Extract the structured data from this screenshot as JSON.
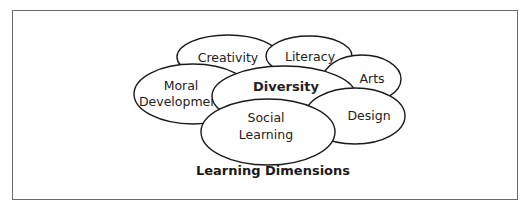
{
  "diagram": {
    "title": "Learning Dimensions",
    "nodes": [
      {
        "id": "creativity",
        "lines": [
          "Creativity"
        ],
        "bold": false
      },
      {
        "id": "literacy",
        "lines": [
          "Literacy"
        ],
        "bold": false
      },
      {
        "id": "arts",
        "lines": [
          "Arts"
        ],
        "bold": false
      },
      {
        "id": "moral-development",
        "lines": [
          "Moral",
          "Development"
        ],
        "bold": false
      },
      {
        "id": "diversity",
        "lines": [
          "Diversity"
        ],
        "bold": true
      },
      {
        "id": "design",
        "lines": [
          "Design"
        ],
        "bold": false
      },
      {
        "id": "social-learning",
        "lines": [
          "Social",
          "Learning"
        ],
        "bold": false
      }
    ],
    "colors": {
      "stroke": "#1a1a1a",
      "fill": "#ffffff",
      "frame": "#6a6a6a"
    }
  }
}
